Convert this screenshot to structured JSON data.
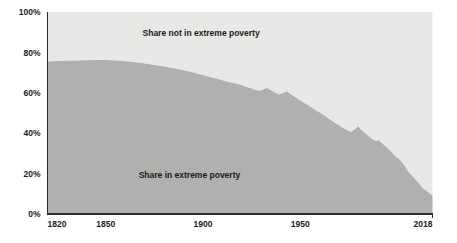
{
  "chart_data": {
    "type": "area",
    "stacked": true,
    "title": "",
    "subtitle": "",
    "xlabel": "",
    "ylabel": "",
    "xlim": [
      1820,
      2018
    ],
    "ylim": [
      0,
      100
    ],
    "grid": false,
    "legend_position": "inline-annotation",
    "x_tick_labels": [
      "1820",
      "1850",
      "1900",
      "1950",
      "2018"
    ],
    "x_ticks": [
      1820,
      1850,
      1900,
      1950,
      2018
    ],
    "y_tick_labels": [
      "0%",
      "20%",
      "40%",
      "60%",
      "80%",
      "100%"
    ],
    "y_ticks": [
      0,
      20,
      40,
      60,
      80,
      100
    ],
    "colors": {
      "share_in_extreme_poverty": "#b0b0ae",
      "share_not_in_extreme_poverty": "#e8e8e6",
      "axis": "#2b2b2b",
      "text": "#1a1a1a",
      "background": "#ffffff"
    },
    "annotations": [
      {
        "text": "Share not in extreme poverty",
        "x": 1899,
        "y": 88
      },
      {
        "text": "Share in extreme poverty",
        "x": 1893,
        "y": 18
      }
    ],
    "series": [
      {
        "name": "Share in extreme poverty",
        "unit": "%",
        "x": [
          1820,
          1825,
          1830,
          1835,
          1840,
          1845,
          1850,
          1855,
          1860,
          1865,
          1870,
          1875,
          1880,
          1885,
          1890,
          1893,
          1896,
          1900,
          1903,
          1906,
          1909,
          1912,
          1915,
          1918,
          1921,
          1924,
          1927,
          1929,
          1931,
          1933,
          1935,
          1937,
          1939,
          1941,
          1943,
          1945,
          1947,
          1949,
          1950,
          1952,
          1954,
          1956,
          1958,
          1960,
          1962,
          1964,
          1966,
          1968,
          1970,
          1972,
          1974,
          1976,
          1978,
          1980,
          1981,
          1983,
          1985,
          1987,
          1989,
          1990,
          1992,
          1994,
          1996,
          1998,
          1999,
          2000,
          2002,
          2004,
          2005,
          2006,
          2008,
          2010,
          2011,
          2012,
          2013,
          2015,
          2016,
          2017,
          2018
        ],
        "values": [
          75.5,
          75.7,
          75.9,
          76.0,
          76.1,
          76.2,
          76.2,
          76.0,
          75.6,
          75.1,
          74.5,
          73.8,
          73.0,
          72.1,
          71.2,
          70.6,
          69.8,
          68.8,
          67.9,
          67.2,
          66.4,
          65.6,
          65.0,
          64.3,
          63.4,
          62.4,
          61.5,
          61.0,
          61.6,
          62.4,
          61.3,
          60.0,
          59.2,
          59.8,
          60.6,
          59.4,
          58.0,
          56.8,
          56.2,
          55.0,
          53.8,
          52.6,
          51.4,
          50.2,
          49.0,
          47.6,
          46.3,
          45.0,
          43.8,
          42.6,
          41.5,
          40.6,
          42.0,
          43.4,
          42.0,
          40.4,
          38.6,
          37.0,
          36.2,
          36.6,
          35.0,
          33.4,
          31.6,
          29.4,
          28.4,
          27.8,
          26.0,
          23.4,
          21.8,
          20.4,
          18.4,
          16.2,
          15.2,
          14.0,
          12.8,
          11.4,
          10.6,
          9.8,
          9.2
        ]
      },
      {
        "name": "Share not in extreme poverty",
        "unit": "%",
        "note": "complement to 100% of the share in extreme poverty series"
      }
    ]
  }
}
